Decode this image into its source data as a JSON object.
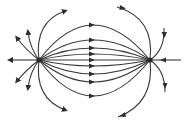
{
  "diagram": {
    "title": "Electric field lines between two charges",
    "kind": "field-lines",
    "colors": {
      "line": "#3a3a3a",
      "background": "#ffffff"
    },
    "charges": [
      {
        "id": "left-charge",
        "x": 39,
        "y": 60
      },
      {
        "id": "right-charge",
        "x": 150,
        "y": 60
      }
    ],
    "inner_lines_count": 9,
    "outer_lines_count": 8,
    "text_labels": []
  }
}
